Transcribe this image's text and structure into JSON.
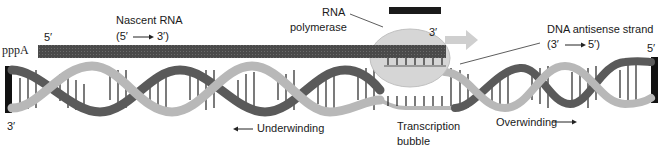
{
  "figure": {
    "colors": {
      "rna_strand": "#4a4a4a",
      "polymerase": "#d6d6d6",
      "polymerase_top_bar": "#1a1a1a",
      "helix_light": "#b8b8b8",
      "helix_dark": "#5a5a5a",
      "end_bar": "#111111",
      "base_pair": "#222222"
    }
  },
  "labels": {
    "pppA": "pppA",
    "rna_5prime": "5′",
    "nascent_rna": "Nascent RNA",
    "nascent_rna_direction_start": "(5′",
    "nascent_rna_direction_end": "3′)",
    "rna_polymerase_line1": "RNA",
    "rna_polymerase_line2": "polymerase",
    "rna_3prime": "3′",
    "dna_antisense_strand": "DNA antisense strand",
    "antisense_direction_start": "(3′",
    "antisense_direction_end": "5′)",
    "dna_right_5prime": "5′",
    "dna_left_3prime": "3′",
    "underwinding": "Underwinding",
    "transcription_bubble_line1": "Transcription",
    "transcription_bubble_line2": "bubble",
    "overwinding": "Overwinding"
  }
}
